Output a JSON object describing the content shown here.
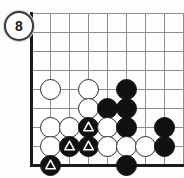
{
  "diagram": {
    "kind": "go-board-problem-diagram",
    "move_label": "8",
    "board": {
      "grid_spacing_px": 19,
      "origin_x_px": 31,
      "origin_y_px": 13,
      "columns": 9,
      "rows": 9,
      "left_edge": true,
      "bottom_edge": true,
      "grid_color": "#8d8d8d",
      "edge_color": "#1a1a1a",
      "background_color": "#fdfdfd"
    },
    "colors": {
      "black_stone": "#111111",
      "white_stone": "#ffffff",
      "stone_outline": "#2b2b2b",
      "label_text": "#1a1a1a"
    },
    "legend": {
      "triangle_meaning": "marked stones"
    },
    "stones": [
      {
        "color": "white",
        "col": 1,
        "row": 4,
        "mark": ""
      },
      {
        "color": "white",
        "col": 3,
        "row": 4,
        "mark": ""
      },
      {
        "color": "black",
        "col": 5,
        "row": 4,
        "mark": ""
      },
      {
        "color": "white",
        "col": 3,
        "row": 5,
        "mark": ""
      },
      {
        "color": "black",
        "col": 4,
        "row": 5,
        "mark": ""
      },
      {
        "color": "black",
        "col": 5,
        "row": 5,
        "mark": ""
      },
      {
        "color": "white",
        "col": 1,
        "row": 6,
        "mark": ""
      },
      {
        "color": "white",
        "col": 2,
        "row": 6,
        "mark": ""
      },
      {
        "color": "black",
        "col": 3,
        "row": 6,
        "mark": "triangle"
      },
      {
        "color": "white",
        "col": 4,
        "row": 6,
        "mark": ""
      },
      {
        "color": "black",
        "col": 5,
        "row": 6,
        "mark": ""
      },
      {
        "color": "black",
        "col": 7,
        "row": 6,
        "mark": ""
      },
      {
        "color": "white",
        "col": 1,
        "row": 7,
        "mark": ""
      },
      {
        "color": "black",
        "col": 2,
        "row": 7,
        "mark": "triangle"
      },
      {
        "color": "black",
        "col": 3,
        "row": 7,
        "mark": "triangle"
      },
      {
        "color": "white",
        "col": 4,
        "row": 7,
        "mark": ""
      },
      {
        "color": "white",
        "col": 5,
        "row": 7,
        "mark": ""
      },
      {
        "color": "white",
        "col": 6,
        "row": 7,
        "mark": ""
      },
      {
        "color": "black",
        "col": 7,
        "row": 7,
        "mark": ""
      },
      {
        "color": "black",
        "col": 1,
        "row": 8,
        "mark": "triangle"
      },
      {
        "color": "black",
        "col": 5,
        "row": 8,
        "mark": ""
      }
    ]
  }
}
